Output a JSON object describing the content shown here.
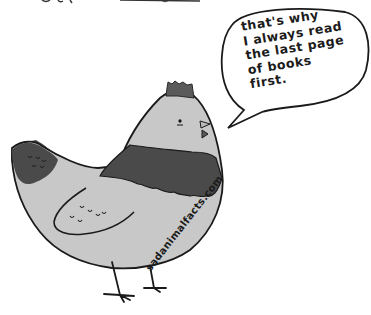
{
  "comic": {
    "title": "Sad Animal Facts",
    "speech_bubble": {
      "lines": [
        "that's why",
        "I always read",
        "the last page",
        "of books",
        "first."
      ]
    },
    "watermark": "sadanimalfacts.com",
    "character": "chicken",
    "colors": {
      "background": "#ffffff",
      "body": "#c8c8c8",
      "dark_feathers": "#4a4a4a",
      "comb": "#5a5a5a",
      "outline": "#1a1a1a"
    }
  }
}
